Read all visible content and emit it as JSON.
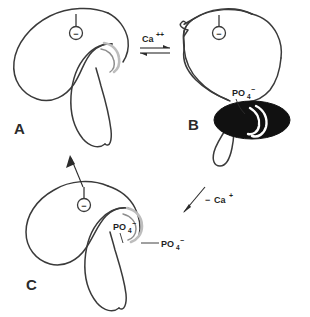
{
  "figure": {
    "background_color": "#ffffff",
    "outline_color": "#3a3a3a",
    "shade_color": "#bdbdbd",
    "vesicle_color": "#111111"
  },
  "panels": [
    {
      "id": "A",
      "letter": "A",
      "receptor": {
        "glyph": "−",
        "name": "minus-charge"
      },
      "structure_label": ""
    },
    {
      "id": "B",
      "letter": "B",
      "receptor": {
        "glyph": "−",
        "name": "minus-charge"
      },
      "structure_label": "PO",
      "structure_label_sub": "4",
      "structure_label_sup": "−"
    },
    {
      "id": "C",
      "letter": "C",
      "receptor": {
        "glyph": "−",
        "name": "minus-charge"
      },
      "labels": [
        {
          "base": "PO",
          "sub": "4",
          "sup": "−"
        },
        {
          "base": "PO",
          "sub": "4",
          "sup": "−"
        }
      ]
    }
  ],
  "reactions": {
    "forward": {
      "species": "Ca",
      "charge": "++",
      "name": "calcium-ion",
      "arrow": "equilibrium"
    },
    "reverse": {
      "label_prefix": "−",
      "species": "Ca",
      "charge": "+",
      "name": "calcium-removal",
      "arrow": "single-diagonal"
    },
    "recycle": {
      "arrow": "single-up",
      "name": "recycle-arrow"
    }
  }
}
